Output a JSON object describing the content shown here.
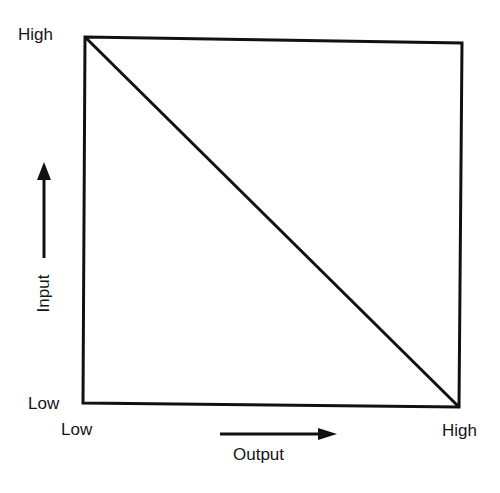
{
  "diagram": {
    "type": "input-output tradeoff diagram",
    "box": {
      "top_left": [
        85,
        37
      ],
      "top_right": [
        462,
        43
      ],
      "bottom_right": [
        459,
        407
      ],
      "bottom_left": [
        83,
        403
      ]
    },
    "diagonal": {
      "from": "top-left (High input, Low output)",
      "to": "bottom-right (Low input, High output)"
    },
    "y_axis": {
      "title": "Input",
      "high_label": "High",
      "low_label": "Low",
      "arrow_direction": "up"
    },
    "x_axis": {
      "title": "Output",
      "low_label": "Low",
      "high_label": "High",
      "arrow_direction": "right"
    },
    "line_color": "#111111",
    "background": "#ffffff"
  }
}
